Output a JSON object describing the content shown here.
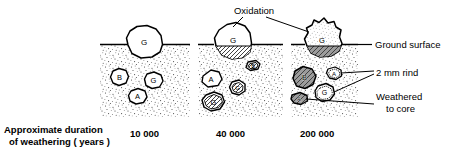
{
  "figure": {
    "title_alt": "Weathering of rock boulders with time",
    "colors": {
      "ink": "#000000",
      "soil_stipple": "#3a3a3a",
      "rind_fill": "#8a8a8a",
      "background": "#ffffff"
    }
  },
  "axis_caption": {
    "line1": "Approximate  duration",
    "line2": "of  weathering ( years )"
  },
  "panels": [
    {
      "id": "panel-10000",
      "duration_label": "10 000",
      "surface_boulder": {
        "label": "G",
        "state": "fresh"
      },
      "buried_clasts": [
        {
          "label": "B",
          "state": "fresh"
        },
        {
          "label": "G",
          "state": "fresh"
        },
        {
          "label": "A",
          "state": "fresh"
        }
      ]
    },
    {
      "id": "panel-40000",
      "duration_label": "40 000",
      "surface_boulder": {
        "label": "G",
        "state": "oxidised-base"
      },
      "buried_clasts": [
        {
          "label": "B",
          "state": "rind"
        },
        {
          "label": "A",
          "state": "fresh"
        },
        {
          "label": "G",
          "state": "rind"
        },
        {
          "label": "G",
          "state": "rind"
        }
      ]
    },
    {
      "id": "panel-200000",
      "duration_label": "200 000",
      "surface_boulder": {
        "label": "G",
        "state": "oxidised-stippled"
      },
      "buried_clasts": [
        {
          "label": "B",
          "state": "weathered-to-core"
        },
        {
          "label": "A",
          "state": "rind"
        },
        {
          "label": "A",
          "state": "weathered-to-core"
        },
        {
          "label": "G",
          "state": "rind"
        }
      ]
    }
  ],
  "annotations": {
    "oxidation": "Oxidation",
    "ground_surface": "Ground  surface",
    "rind": "2  mm  rind",
    "weathered_line1": "Weathered",
    "weathered_line2": "to  core"
  }
}
